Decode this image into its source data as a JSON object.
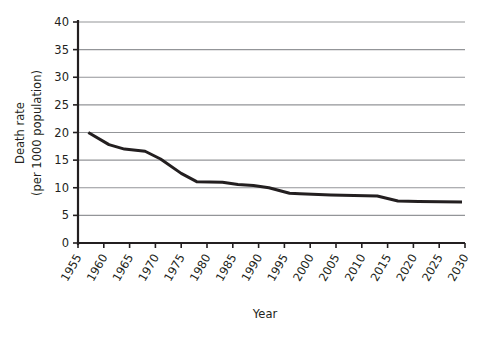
{
  "chart_data": {
    "type": "line",
    "title": "",
    "xlabel": "Year",
    "ylabel": "Death rate (per 1000 population)",
    "ylabel_line1": "Death rate",
    "ylabel_line2": "(per 1000 population)",
    "xlim": [
      1955,
      2030
    ],
    "ylim": [
      0,
      40
    ],
    "xticks": [
      1955,
      1960,
      1965,
      1970,
      1975,
      1980,
      1985,
      1990,
      1995,
      2000,
      2005,
      2010,
      2015,
      2020,
      2025,
      2030
    ],
    "xtick_labels": [
      "1955",
      "1960",
      "1965",
      "1970",
      "1975",
      "1980",
      "1985",
      "1990",
      "1995",
      "2000",
      "2005",
      "2010",
      "2015",
      "2020",
      "2025",
      "2030"
    ],
    "yticks": [
      0,
      5,
      10,
      15,
      20,
      25,
      30,
      35,
      40
    ],
    "ytick_labels": [
      "0",
      "5",
      "10",
      "15",
      "20",
      "25",
      "30",
      "35",
      "40"
    ],
    "grid": "horizontal",
    "legend": "none",
    "series": [
      {
        "name": "Death rate",
        "color": "#231f20",
        "line_width": 3,
        "x": [
          1957,
          1961,
          1964,
          1968,
          1971,
          1975,
          1978,
          1983,
          1986,
          1989,
          1992,
          1996,
          1998,
          2004,
          2013,
          2017,
          2021,
          2030
        ],
        "values": [
          20.0,
          17.8,
          17.0,
          16.6,
          15.2,
          12.6,
          11.1,
          11.0,
          10.6,
          10.4,
          10.0,
          9.0,
          8.9,
          8.7,
          8.5,
          7.6,
          7.5,
          7.4
        ]
      }
    ]
  },
  "geometry": {
    "plot_left": 78,
    "plot_right": 465,
    "plot_top": 22,
    "plot_bottom": 243,
    "line_end_x": 462
  },
  "colors": {
    "line": "#231f20",
    "grid": "#939598",
    "axis": "#231f20",
    "background": "#ffffff"
  }
}
